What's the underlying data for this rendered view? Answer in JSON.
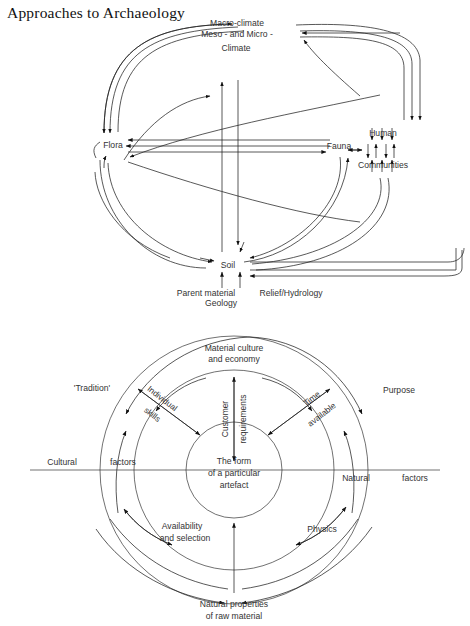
{
  "page": {
    "title": "Approaches to Archaeology",
    "background": "#ffffff",
    "ink": "#222222"
  },
  "figure1": {
    "name": "ecosystem-approach-diagram",
    "nodes": {
      "macro_climate": "Macro-climate",
      "meso_micro": "Meso - and Micro -",
      "climate": "Climate",
      "flora": "Flora",
      "fauna": "Fauna",
      "human": "Human",
      "communities": "Communities",
      "soil": "Soil",
      "parent_material": "Parent material",
      "geology": "Geology",
      "relief_hydrology": "Relief/Hydrology"
    }
  },
  "figure2": {
    "name": "artefact-form-factors-diagram",
    "center": {
      "line1": "The form",
      "line2": "of a particular",
      "line3": "artefact"
    },
    "outer_nodes": {
      "material_culture_1": "Material culture",
      "material_culture_2": "and economy",
      "tradition": "'Tradition'",
      "purpose": "Purpose",
      "natural_properties_1": "Natural properties",
      "natural_properties_2": "of raw material"
    },
    "spokes": {
      "customer_requirements_1": "Customer",
      "customer_requirements_2": "requirements",
      "individual_skills_1": "Individual",
      "individual_skills_2": "skills",
      "time_available_1": "Time",
      "time_available_2": "available",
      "availability_1": "Availability",
      "availability_2": "and selection",
      "physics": "Physics"
    },
    "axis": {
      "cultural": "Cultural",
      "cultural_factors": "factors",
      "natural": "Natural",
      "natural_factors": "factors"
    }
  }
}
